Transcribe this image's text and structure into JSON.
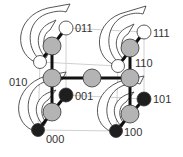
{
  "diagram": {
    "type": "cube-state-diagram",
    "colors": {
      "grey_node": "#b4b4b4",
      "white_node": "#ffffff",
      "black_node": "#1e1e1e",
      "edge": "#111111",
      "guide": "#cfcfcf",
      "arrow_stroke": "#444444"
    },
    "labels": {
      "s011": "011",
      "s111": "111",
      "s010": "010",
      "s110": "110",
      "s001": "001",
      "s101": "101",
      "s000": "000",
      "s100": "100"
    }
  }
}
